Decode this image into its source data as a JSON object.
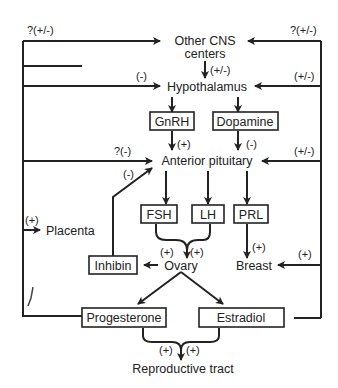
{
  "diagram": {
    "nodes": {
      "other_cns": "Other CNS",
      "other_cns_2": "centers",
      "hypothalamus": "Hypothalamus",
      "gnrh": "GnRH",
      "dopamine": "Dopamine",
      "anterior_pituitary": "Anterior pituitary",
      "fsh": "FSH",
      "lh": "LH",
      "prl": "PRL",
      "placenta": "Placenta",
      "inhibin": "Inhibin",
      "ovary": "Ovary",
      "breast": "Breast",
      "progesterone": "Progesterone",
      "estradiol": "Estradiol",
      "reproductive_tract": "Reproductive tract"
    },
    "edge_labels": {
      "left_to_cns": "?(+/-)",
      "right_to_cns": "?(+/-)",
      "cns_to_hypo": "(+/-)",
      "left_to_hypo": "(-)",
      "right_to_hypo": "(+/-)",
      "gnrh_to_ap": "(+)",
      "dopamine_to_ap": "(-)",
      "left_to_ap": "?(-)",
      "inhibin_to_ap": "(-)",
      "right_to_ap": "(+/-)",
      "to_placenta": "(+)",
      "fsh_to_ovary": "(+)",
      "lh_to_ovary": "(+)",
      "prl_to_breast": "(+)",
      "right_to_breast": "(+)",
      "prog_to_tract": "(+)",
      "estr_to_tract": "(+)"
    },
    "edges": [
      {
        "from": "Other CNS centers",
        "to": "Hypothalamus",
        "sign": "(+/-)"
      },
      {
        "from": "Hypothalamus",
        "to": "GnRH"
      },
      {
        "from": "Hypothalamus",
        "to": "Dopamine"
      },
      {
        "from": "GnRH",
        "to": "Anterior pituitary",
        "sign": "(+)"
      },
      {
        "from": "Dopamine",
        "to": "Anterior pituitary",
        "sign": "(-)"
      },
      {
        "from": "Anterior pituitary",
        "to": "FSH"
      },
      {
        "from": "Anterior pituitary",
        "to": "LH"
      },
      {
        "from": "Anterior pituitary",
        "to": "PRL"
      },
      {
        "from": "FSH",
        "to": "Ovary",
        "sign": "(+)"
      },
      {
        "from": "LH",
        "to": "Ovary",
        "sign": "(+)"
      },
      {
        "from": "PRL",
        "to": "Breast",
        "sign": "(+)"
      },
      {
        "from": "Ovary",
        "to": "Inhibin"
      },
      {
        "from": "Inhibin",
        "to": "Anterior pituitary",
        "sign": "(-)"
      },
      {
        "from": "Ovary",
        "to": "Progesterone"
      },
      {
        "from": "Ovary",
        "to": "Estradiol"
      },
      {
        "from": "Progesterone",
        "to": "Other CNS centers",
        "sign": "?(+/-)"
      },
      {
        "from": "Progesterone",
        "to": "Hypothalamus",
        "sign": "(-)"
      },
      {
        "from": "Progesterone",
        "to": "Anterior pituitary",
        "sign": "?(-)"
      },
      {
        "from": "Progesterone",
        "to": "Placenta",
        "sign": "(+)"
      },
      {
        "from": "Estradiol",
        "to": "Other CNS centers",
        "sign": "?(+/-)"
      },
      {
        "from": "Estradiol",
        "to": "Hypothalamus",
        "sign": "(+/-)"
      },
      {
        "from": "Estradiol",
        "to": "Anterior pituitary",
        "sign": "(+/-)"
      },
      {
        "from": "Estradiol",
        "to": "Breast",
        "sign": "(+)"
      },
      {
        "from": "Progesterone",
        "to": "Reproductive tract",
        "sign": "(+)"
      },
      {
        "from": "Estradiol",
        "to": "Reproductive tract",
        "sign": "(+)"
      }
    ]
  }
}
